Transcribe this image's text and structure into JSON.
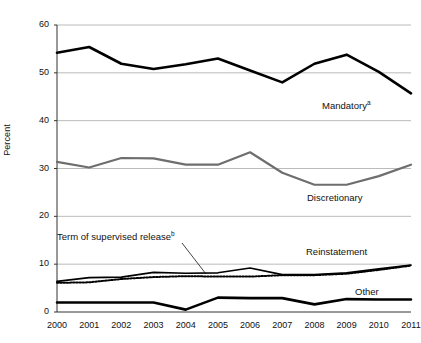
{
  "chart_data": {
    "type": "line",
    "title": "",
    "xlabel": "",
    "ylabel": "Percent",
    "ylim": [
      0,
      60
    ],
    "yticks": [
      0,
      10,
      20,
      30,
      40,
      50,
      60
    ],
    "grid": true,
    "legend_position": "inline-annotations",
    "categories": [
      "2000",
      "2001",
      "2002",
      "2003",
      "2004",
      "2005",
      "2006",
      "2007",
      "2008",
      "2009",
      "2010",
      "2011"
    ],
    "x": [
      2000,
      2001,
      2002,
      2003,
      2004,
      2005,
      2006,
      2007,
      2008,
      2009,
      2010,
      2011
    ],
    "series": [
      {
        "name": "Mandatory",
        "name_sup": "a",
        "style": "solid-thick-black",
        "color": "#000000",
        "values": [
          54.2,
          55.4,
          51.9,
          50.8,
          51.8,
          53.0,
          50.5,
          48.0,
          51.9,
          53.8,
          50.2,
          45.7
        ]
      },
      {
        "name": "Discretionary",
        "name_sup": "",
        "style": "solid-gray",
        "color": "#6e6e6e",
        "values": [
          31.4,
          30.2,
          32.2,
          32.1,
          30.8,
          30.8,
          33.4,
          29.1,
          26.6,
          26.6,
          28.4,
          30.8
        ]
      },
      {
        "name": "Reinstatement",
        "name_sup": "",
        "style": "solid-black-thin",
        "color": "#000000",
        "values": [
          6.4,
          7.2,
          7.3,
          8.3,
          8.1,
          8.2,
          9.2,
          7.8,
          7.8,
          8.2,
          9.0,
          9.8
        ]
      },
      {
        "name": "Term of supervised release",
        "name_sup": "b",
        "style": "dotted-black",
        "color": "#000000",
        "values": [
          6.1,
          6.2,
          6.9,
          7.3,
          7.5,
          7.4,
          7.4,
          7.7,
          7.7,
          8.0,
          8.8,
          9.7
        ]
      },
      {
        "name": "Other",
        "name_sup": "",
        "style": "solid-thick-black",
        "color": "#000000",
        "values": [
          2.0,
          2.0,
          2.0,
          2.0,
          0.5,
          3.0,
          2.9,
          2.9,
          1.6,
          2.7,
          2.6,
          2.6
        ]
      }
    ],
    "annotations": [
      {
        "text": "Mandatory",
        "sup": "a",
        "x_px": 322,
        "y_px": 100
      },
      {
        "text": "Discretionary",
        "sup": "",
        "x_px": 307,
        "y_px": 192
      },
      {
        "text": "Term of supervised release",
        "sup": "b",
        "x_px": 57,
        "y_px": 231
      },
      {
        "text": "Reinstatement",
        "sup": "",
        "x_px": 306,
        "y_px": 246
      },
      {
        "text": "Other",
        "sup": "",
        "x_px": 355,
        "y_px": 286
      }
    ],
    "leader_line": {
      "from_x_px": 182,
      "from_y_px": 243,
      "to_x_px": 206,
      "to_y_px": 274
    }
  },
  "colors": {
    "mandatory": "#000000",
    "discretionary": "#6e6e6e",
    "reinstatement": "#000000",
    "term_of_supervised_release": "#000000",
    "other": "#000000",
    "gridline": "#a9a9a9",
    "axis": "#333333",
    "background": "#ffffff"
  }
}
